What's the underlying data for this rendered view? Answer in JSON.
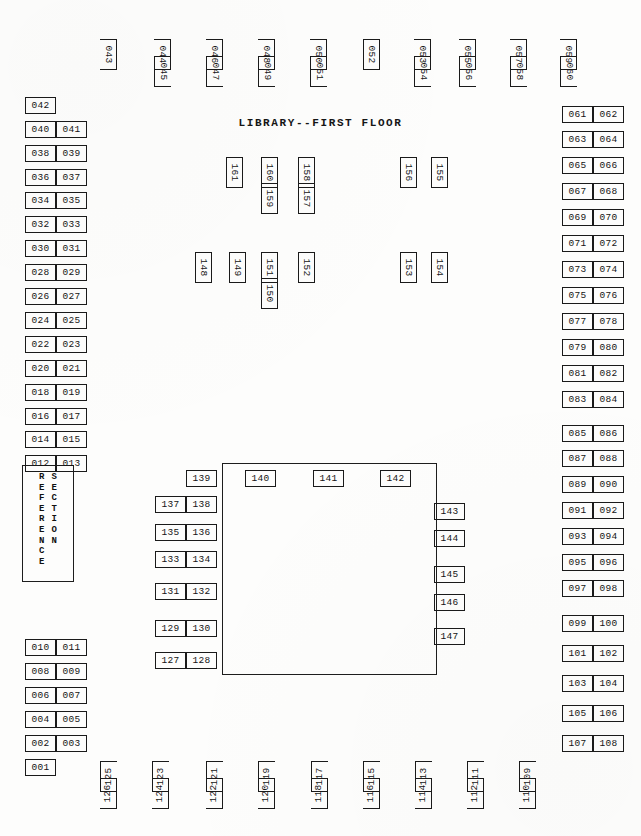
{
  "document": {
    "title": "LIBRARY--FIRST FLOOR",
    "type": "floor-plan-map"
  },
  "reference_section": {
    "label": "REFERENCE SECTION",
    "column_left": "REFERENCE",
    "column_right": "SECTION"
  },
  "top_row": [
    {
      "id": "043",
      "x": 93,
      "y": 46,
      "sides": "nb"
    },
    {
      "id": "044",
      "x": 147,
      "y": 46,
      "sides": "nb"
    },
    {
      "id": "045",
      "x": 147,
      "y": 63,
      "sides": "nt"
    },
    {
      "id": "046",
      "x": 199,
      "y": 46,
      "sides": "nb"
    },
    {
      "id": "047",
      "x": 199,
      "y": 63,
      "sides": "nt"
    },
    {
      "id": "048",
      "x": 251,
      "y": 46,
      "sides": "nb"
    },
    {
      "id": "049",
      "x": 251,
      "y": 63,
      "sides": "nt"
    },
    {
      "id": "050",
      "x": 303,
      "y": 46,
      "sides": "nb"
    },
    {
      "id": "051",
      "x": 303,
      "y": 63,
      "sides": "nt"
    },
    {
      "id": "052",
      "x": 356,
      "y": 46,
      "sides": "all"
    },
    {
      "id": "053",
      "x": 407,
      "y": 46,
      "sides": "nb"
    },
    {
      "id": "054",
      "x": 407,
      "y": 63,
      "sides": "nt"
    },
    {
      "id": "055",
      "x": 452,
      "y": 46,
      "sides": "nb"
    },
    {
      "id": "056",
      "x": 452,
      "y": 63,
      "sides": "nt"
    },
    {
      "id": "057",
      "x": 503,
      "y": 46,
      "sides": "nb"
    },
    {
      "id": "058",
      "x": 503,
      "y": 63,
      "sides": "nt"
    },
    {
      "id": "059",
      "x": 553,
      "y": 46,
      "sides": "nb"
    },
    {
      "id": "060",
      "x": 553,
      "y": 63,
      "sides": "nt"
    }
  ],
  "left_column_upper": [
    {
      "id": "042",
      "x": 25,
      "y": 97
    },
    {
      "id": "040",
      "x": 25,
      "y": 121
    },
    {
      "id": "041",
      "x": 56,
      "y": 121
    },
    {
      "id": "038",
      "x": 25,
      "y": 145
    },
    {
      "id": "039",
      "x": 56,
      "y": 145
    },
    {
      "id": "036",
      "x": 25,
      "y": 169
    },
    {
      "id": "037",
      "x": 56,
      "y": 169
    },
    {
      "id": "034",
      "x": 25,
      "y": 192
    },
    {
      "id": "035",
      "x": 56,
      "y": 192
    },
    {
      "id": "032",
      "x": 25,
      "y": 216
    },
    {
      "id": "033",
      "x": 56,
      "y": 216
    },
    {
      "id": "030",
      "x": 25,
      "y": 240
    },
    {
      "id": "031",
      "x": 56,
      "y": 240
    },
    {
      "id": "028",
      "x": 25,
      "y": 264
    },
    {
      "id": "029",
      "x": 56,
      "y": 264
    },
    {
      "id": "026",
      "x": 25,
      "y": 288
    },
    {
      "id": "027",
      "x": 56,
      "y": 288
    },
    {
      "id": "024",
      "x": 25,
      "y": 312
    },
    {
      "id": "025",
      "x": 56,
      "y": 312
    },
    {
      "id": "022",
      "x": 25,
      "y": 336
    },
    {
      "id": "023",
      "x": 56,
      "y": 336
    },
    {
      "id": "020",
      "x": 25,
      "y": 360
    },
    {
      "id": "021",
      "x": 56,
      "y": 360
    },
    {
      "id": "018",
      "x": 25,
      "y": 384
    },
    {
      "id": "019",
      "x": 56,
      "y": 384
    },
    {
      "id": "016",
      "x": 25,
      "y": 408
    },
    {
      "id": "017",
      "x": 56,
      "y": 408
    },
    {
      "id": "014",
      "x": 25,
      "y": 431
    },
    {
      "id": "015",
      "x": 56,
      "y": 431
    },
    {
      "id": "012",
      "x": 25,
      "y": 455
    },
    {
      "id": "013",
      "x": 56,
      "y": 455
    }
  ],
  "left_column_lower": [
    {
      "id": "010",
      "x": 25,
      "y": 639
    },
    {
      "id": "011",
      "x": 56,
      "y": 639
    },
    {
      "id": "008",
      "x": 25,
      "y": 663
    },
    {
      "id": "009",
      "x": 56,
      "y": 663
    },
    {
      "id": "006",
      "x": 25,
      "y": 687
    },
    {
      "id": "007",
      "x": 56,
      "y": 687
    },
    {
      "id": "004",
      "x": 25,
      "y": 711
    },
    {
      "id": "005",
      "x": 56,
      "y": 711
    },
    {
      "id": "002",
      "x": 25,
      "y": 735
    },
    {
      "id": "003",
      "x": 56,
      "y": 735
    },
    {
      "id": "001",
      "x": 25,
      "y": 759
    }
  ],
  "right_column": [
    {
      "id": "061",
      "x": 562,
      "y": 106
    },
    {
      "id": "062",
      "x": 593,
      "y": 106
    },
    {
      "id": "063",
      "x": 562,
      "y": 131
    },
    {
      "id": "064",
      "x": 593,
      "y": 131
    },
    {
      "id": "065",
      "x": 562,
      "y": 157
    },
    {
      "id": "066",
      "x": 593,
      "y": 157
    },
    {
      "id": "067",
      "x": 562,
      "y": 183
    },
    {
      "id": "068",
      "x": 593,
      "y": 183
    },
    {
      "id": "069",
      "x": 562,
      "y": 209
    },
    {
      "id": "070",
      "x": 593,
      "y": 209
    },
    {
      "id": "071",
      "x": 562,
      "y": 235
    },
    {
      "id": "072",
      "x": 593,
      "y": 235
    },
    {
      "id": "073",
      "x": 562,
      "y": 261
    },
    {
      "id": "074",
      "x": 593,
      "y": 261
    },
    {
      "id": "075",
      "x": 562,
      "y": 287
    },
    {
      "id": "076",
      "x": 593,
      "y": 287
    },
    {
      "id": "077",
      "x": 562,
      "y": 313
    },
    {
      "id": "078",
      "x": 593,
      "y": 313
    },
    {
      "id": "079",
      "x": 562,
      "y": 339
    },
    {
      "id": "080",
      "x": 593,
      "y": 339
    },
    {
      "id": "081",
      "x": 562,
      "y": 365
    },
    {
      "id": "082",
      "x": 593,
      "y": 365
    },
    {
      "id": "083",
      "x": 562,
      "y": 391
    },
    {
      "id": "084",
      "x": 593,
      "y": 391
    },
    {
      "id": "085",
      "x": 562,
      "y": 425
    },
    {
      "id": "086",
      "x": 593,
      "y": 425
    },
    {
      "id": "087",
      "x": 562,
      "y": 450
    },
    {
      "id": "088",
      "x": 593,
      "y": 450
    },
    {
      "id": "089",
      "x": 562,
      "y": 476
    },
    {
      "id": "090",
      "x": 593,
      "y": 476
    },
    {
      "id": "091",
      "x": 562,
      "y": 502
    },
    {
      "id": "092",
      "x": 593,
      "y": 502
    },
    {
      "id": "093",
      "x": 562,
      "y": 528
    },
    {
      "id": "094",
      "x": 593,
      "y": 528
    },
    {
      "id": "095",
      "x": 562,
      "y": 554
    },
    {
      "id": "096",
      "x": 593,
      "y": 554
    },
    {
      "id": "097",
      "x": 562,
      "y": 580
    },
    {
      "id": "098",
      "x": 593,
      "y": 580
    },
    {
      "id": "099",
      "x": 562,
      "y": 615
    },
    {
      "id": "100",
      "x": 593,
      "y": 615
    },
    {
      "id": "101",
      "x": 562,
      "y": 645
    },
    {
      "id": "102",
      "x": 593,
      "y": 645
    },
    {
      "id": "103",
      "x": 562,
      "y": 675
    },
    {
      "id": "104",
      "x": 593,
      "y": 675
    },
    {
      "id": "105",
      "x": 562,
      "y": 705
    },
    {
      "id": "106",
      "x": 593,
      "y": 705
    },
    {
      "id": "107",
      "x": 562,
      "y": 735
    },
    {
      "id": "108",
      "x": 593,
      "y": 735
    }
  ],
  "bottom_row": [
    {
      "id": "125",
      "x": 93,
      "y": 768,
      "sides": "nb"
    },
    {
      "id": "126",
      "x": 93,
      "y": 785,
      "sides": "nt"
    },
    {
      "id": "123",
      "x": 145,
      "y": 768,
      "sides": "nb"
    },
    {
      "id": "124",
      "x": 145,
      "y": 785,
      "sides": "nt"
    },
    {
      "id": "121",
      "x": 199,
      "y": 768,
      "sides": "nb"
    },
    {
      "id": "122",
      "x": 199,
      "y": 785,
      "sides": "nt"
    },
    {
      "id": "119",
      "x": 251,
      "y": 768,
      "sides": "nb"
    },
    {
      "id": "120",
      "x": 251,
      "y": 785,
      "sides": "nt"
    },
    {
      "id": "117",
      "x": 304,
      "y": 768,
      "sides": "nb"
    },
    {
      "id": "118",
      "x": 304,
      "y": 785,
      "sides": "nt"
    },
    {
      "id": "115",
      "x": 356,
      "y": 768,
      "sides": "nb"
    },
    {
      "id": "116",
      "x": 356,
      "y": 785,
      "sides": "nt"
    },
    {
      "id": "113",
      "x": 408,
      "y": 768,
      "sides": "nb"
    },
    {
      "id": "114",
      "x": 408,
      "y": 785,
      "sides": "nt"
    },
    {
      "id": "111",
      "x": 460,
      "y": 768,
      "sides": "nb"
    },
    {
      "id": "112",
      "x": 460,
      "y": 785,
      "sides": "nt"
    },
    {
      "id": "109",
      "x": 512,
      "y": 768,
      "sides": "nb"
    },
    {
      "id": "110",
      "x": 512,
      "y": 785,
      "sides": "nt"
    }
  ],
  "interior_upper": [
    {
      "id": "161",
      "x": 219,
      "y": 164
    },
    {
      "id": "160",
      "x": 254,
      "y": 164
    },
    {
      "id": "159",
      "x": 254,
      "y": 190
    },
    {
      "id": "158",
      "x": 291,
      "y": 164
    },
    {
      "id": "157",
      "x": 291,
      "y": 190
    },
    {
      "id": "156",
      "x": 393,
      "y": 164
    },
    {
      "id": "155",
      "x": 424,
      "y": 164
    }
  ],
  "interior_middle": [
    {
      "id": "148",
      "x": 188,
      "y": 259
    },
    {
      "id": "149",
      "x": 222,
      "y": 259
    },
    {
      "id": "151",
      "x": 254,
      "y": 259
    },
    {
      "id": "150",
      "x": 254,
      "y": 285
    },
    {
      "id": "152",
      "x": 291,
      "y": 259
    },
    {
      "id": "153",
      "x": 393,
      "y": 259
    },
    {
      "id": "154",
      "x": 424,
      "y": 259
    }
  ],
  "central_room_left": [
    {
      "id": "139",
      "x": 186,
      "y": 470
    },
    {
      "id": "137",
      "x": 155,
      "y": 496
    },
    {
      "id": "138",
      "x": 186,
      "y": 496
    },
    {
      "id": "135",
      "x": 155,
      "y": 524
    },
    {
      "id": "136",
      "x": 186,
      "y": 524
    },
    {
      "id": "133",
      "x": 155,
      "y": 551
    },
    {
      "id": "134",
      "x": 186,
      "y": 551
    },
    {
      "id": "131",
      "x": 155,
      "y": 583
    },
    {
      "id": "132",
      "x": 186,
      "y": 583
    },
    {
      "id": "129",
      "x": 155,
      "y": 620
    },
    {
      "id": "130",
      "x": 186,
      "y": 620
    },
    {
      "id": "127",
      "x": 155,
      "y": 652
    },
    {
      "id": "128",
      "x": 186,
      "y": 652
    }
  ],
  "central_room_top": [
    {
      "id": "140",
      "x": 245,
      "y": 470
    },
    {
      "id": "141",
      "x": 313,
      "y": 470
    },
    {
      "id": "142",
      "x": 380,
      "y": 470
    }
  ],
  "central_room_right": [
    {
      "id": "143",
      "x": 434,
      "y": 503
    },
    {
      "id": "144",
      "x": 434,
      "y": 530
    },
    {
      "id": "145",
      "x": 434,
      "y": 566
    },
    {
      "id": "146",
      "x": 434,
      "y": 594
    },
    {
      "id": "147",
      "x": 434,
      "y": 628
    }
  ],
  "colors": {
    "ink": "#151515",
    "paper": "#fdfdfc"
  }
}
